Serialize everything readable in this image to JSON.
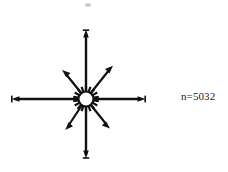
{
  "figure": {
    "type": "rose-diagram",
    "background_color": "#ffffff",
    "ink_color": "#111111",
    "center": {
      "x": 86,
      "y": 99
    },
    "hub": {
      "name": "center-hub",
      "outer_radius": 11,
      "inner_radius": 7.5,
      "fill": "#ffffff",
      "spike_count": 18,
      "spike_length": 5.5,
      "spike_width": 2.2
    },
    "annotation": {
      "sample_size_label": "n=5032",
      "x": 181,
      "y": 90,
      "font_size_px": 11,
      "color": "#1a1a1a"
    }
  },
  "chart_data": {
    "type": "rose",
    "title": "",
    "subtitle": "",
    "xlabel": "",
    "ylabel": "",
    "grid": false,
    "legend": "none",
    "annotations": [
      "n=5032"
    ],
    "sample_size": 5032,
    "units": "degrees",
    "angle_convention": "0 deg = East, counter-clockwise positive",
    "categories": [
      "E (0°)",
      "NE (45°)",
      "N (90°)",
      "NW (135°)",
      "W (180°)",
      "SW (225°)",
      "S (270°)",
      "SE (315°)"
    ],
    "angles_deg": [
      0,
      45,
      90,
      135,
      180,
      225,
      270,
      315
    ],
    "values": [
      59,
      33,
      69,
      33,
      74,
      31,
      59,
      33
    ],
    "value_label": "ray length (px)",
    "rlim": [
      0,
      80
    ],
    "rays": [
      {
        "name": "ray-east",
        "angle_deg": 0,
        "length": 59,
        "tip": {
          "x": 145,
          "y": 99
        },
        "arrowhead": true,
        "weight": 2.4
      },
      {
        "name": "ray-northeast",
        "angle_deg": 45,
        "length": 33,
        "tip": {
          "x": 113,
          "y": 66
        },
        "arrowhead": true,
        "weight": 2.2
      },
      {
        "name": "ray-north",
        "angle_deg": 90,
        "length": 69,
        "tip": {
          "x": 86,
          "y": 30
        },
        "arrowhead": true,
        "weight": 2.4
      },
      {
        "name": "ray-northwest",
        "angle_deg": 135,
        "length": 33,
        "tip": {
          "x": 62,
          "y": 71
        },
        "arrowhead": true,
        "weight": 2.2
      },
      {
        "name": "ray-west",
        "angle_deg": 180,
        "length": 74,
        "tip": {
          "x": 12,
          "y": 99
        },
        "arrowhead": true,
        "weight": 2.4
      },
      {
        "name": "ray-southwest",
        "angle_deg": 225,
        "length": 31,
        "tip": {
          "x": 65,
          "y": 129
        },
        "arrowhead": true,
        "weight": 2.2
      },
      {
        "name": "ray-south",
        "angle_deg": 270,
        "length": 59,
        "tip": {
          "x": 86,
          "y": 158
        },
        "arrowhead": true,
        "weight": 2.4
      },
      {
        "name": "ray-southeast",
        "angle_deg": 315,
        "length": 33,
        "tip": {
          "x": 110,
          "y": 128
        },
        "arrowhead": true,
        "weight": 2.2
      }
    ]
  },
  "artifacts": [
    {
      "name": "scan-speck",
      "x": 85,
      "y": 3,
      "width": 6,
      "height": 4,
      "color": "#cfcfcf"
    }
  ]
}
